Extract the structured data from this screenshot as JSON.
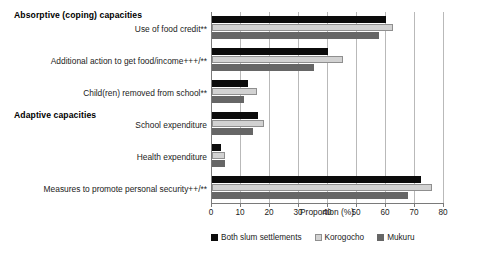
{
  "chart_data": {
    "type": "bar",
    "orientation": "horizontal",
    "title": "",
    "xlabel": "Proportion (%)",
    "ylabel": "",
    "xlim": [
      0,
      80
    ],
    "xticks": [
      0,
      10,
      20,
      30,
      40,
      50,
      60,
      70,
      80
    ],
    "grid": true,
    "legend_position": "bottom",
    "sections": [
      {
        "label": "Absorptive (coping) capacities"
      },
      {
        "label": "Adaptive capacities"
      }
    ],
    "categories": [
      "Use of food credit**",
      "Additional action to get food/income+++/**",
      "Child(ren) removed from school**",
      "School expenditure",
      "Health expenditure",
      "Measures to promote personal security++/**"
    ],
    "series": [
      {
        "name": "Both slum settlements",
        "color": "#0b0b0b",
        "values": [
          60,
          40,
          12.5,
          16,
          3,
          72
        ]
      },
      {
        "name": "Korogocho",
        "color": "#d2d2d2",
        "values": [
          62.5,
          45,
          15.5,
          18,
          4.5,
          76
        ]
      },
      {
        "name": "Mukuru",
        "color": "#666666",
        "values": [
          57.5,
          35,
          11,
          14,
          4.5,
          67.5
        ]
      }
    ]
  },
  "axis": {
    "tick_labels": [
      "0",
      "10",
      "20",
      "30",
      "40",
      "50",
      "60",
      "70",
      "80"
    ],
    "x_title": "Proportion (%)"
  },
  "legend": {
    "items": [
      {
        "label": "Both slum settlements"
      },
      {
        "label": "Korogocho"
      },
      {
        "label": "Mukuru"
      }
    ]
  }
}
